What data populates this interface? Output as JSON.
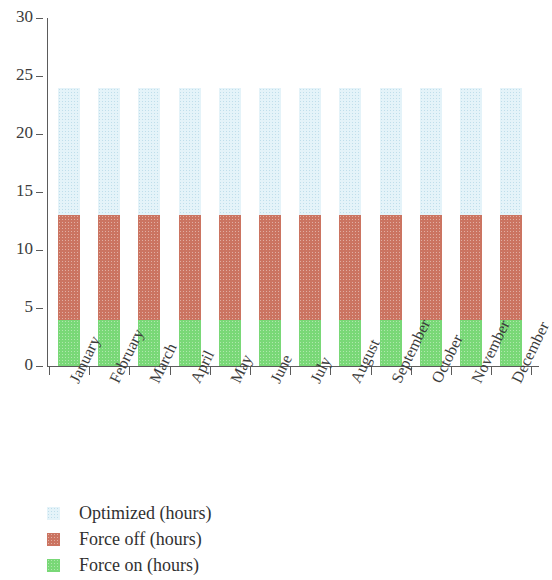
{
  "chart_data": {
    "type": "bar",
    "stacked": true,
    "title": "",
    "xlabel": "",
    "ylabel": "",
    "ylim": [
      0,
      30
    ],
    "yticks": [
      0,
      5,
      10,
      15,
      20,
      25,
      30
    ],
    "grid": false,
    "legend_position": "bottom-left",
    "categories": [
      "January",
      "February",
      "March",
      "April",
      "May",
      "June",
      "July",
      "August",
      "September",
      "October",
      "November",
      "December"
    ],
    "series": [
      {
        "name": "Force on (hours)",
        "color": "#79d877",
        "values": [
          4,
          4,
          4,
          4,
          4,
          4,
          4,
          4,
          4,
          4,
          4,
          4
        ]
      },
      {
        "name": "Force off (hours)",
        "color": "#cb7461",
        "values": [
          9,
          9,
          9,
          9,
          9,
          9,
          9,
          9,
          9,
          9,
          9,
          9
        ]
      },
      {
        "name": "Optimized (hours)",
        "color": "#e4f3f9",
        "values": [
          11,
          11,
          11,
          11,
          11,
          11,
          11,
          11,
          11,
          11,
          11,
          11
        ]
      }
    ],
    "stack_totals": [
      24,
      24,
      24,
      24,
      24,
      24,
      24,
      24,
      24,
      24,
      24,
      24
    ]
  },
  "legend": {
    "entries": [
      {
        "label": "Optimized (hours)",
        "color": "#e4f3f9",
        "swatch_name": "legend-swatch-optimized"
      },
      {
        "label": "Force off (hours)",
        "color": "#cb7461",
        "swatch_name": "legend-swatch-force-off"
      },
      {
        "label": "Force on (hours)",
        "color": "#79d877",
        "swatch_name": "legend-swatch-force-on"
      }
    ]
  }
}
